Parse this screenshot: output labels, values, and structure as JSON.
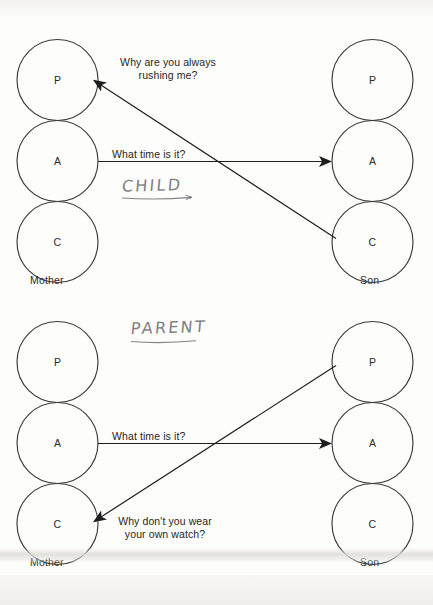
{
  "page": {
    "ego_states": [
      "P",
      "A",
      "C"
    ]
  },
  "diagrams": [
    {
      "id": "crossed-transaction-child",
      "left_person": "Mother",
      "right_person": "Son",
      "left_states": [
        "P",
        "A",
        "C"
      ],
      "right_states": [
        "P",
        "A",
        "C"
      ],
      "stimulus_text": "What time is it?",
      "response_text": "Why are you always\nrushing me?",
      "annotation": "CHILD",
      "stimulus": {
        "from": "Mother A",
        "to": "Son A"
      },
      "response": {
        "from": "Son C",
        "to": "Mother P"
      }
    },
    {
      "id": "crossed-transaction-parent",
      "left_person": "Mother",
      "right_person": "Son",
      "left_states": [
        "P",
        "A",
        "C"
      ],
      "right_states": [
        "P",
        "A",
        "C"
      ],
      "stimulus_text": "What time is it?",
      "response_text": "Why don't you wear\nyour own watch?",
      "annotation": "PARENT",
      "stimulus": {
        "from": "Mother A",
        "to": "Son A"
      },
      "response": {
        "from": "Son P",
        "to": "Mother C"
      }
    }
  ],
  "colors": {
    "ink": "#262626",
    "circle_stroke": "#3a3a3a",
    "pencil": "#6f6f72",
    "paper": "#fdfdfc"
  }
}
